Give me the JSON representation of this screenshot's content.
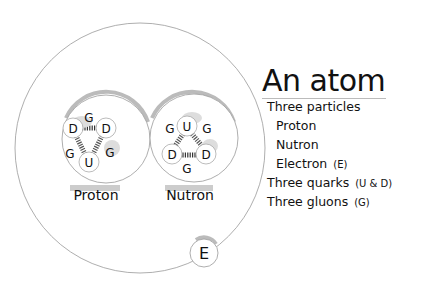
{
  "title": "An atom",
  "list": {
    "particles_heading": "Three particles",
    "particles": [
      {
        "label": "Proton",
        "note": ""
      },
      {
        "label": "Nutron",
        "note": ""
      },
      {
        "label": "Electron",
        "note": "(E)"
      }
    ],
    "quarks": {
      "label": "Three quarks",
      "note": "(U & D)"
    },
    "gluons": {
      "label": "Three gluons",
      "note": "(G)"
    }
  },
  "diagram": {
    "proton_label": "Proton",
    "nutron_label": "Nutron",
    "electron_label": "E",
    "proton_quarks": [
      "D",
      "D",
      "U"
    ],
    "proton_gluons": [
      "G",
      "G",
      "G"
    ],
    "nutron_quarks": [
      "U",
      "D",
      "D"
    ],
    "nutron_gluons": [
      "G",
      "G",
      "G"
    ]
  },
  "colors": {
    "line": "#888888",
    "shadow": "#bbbbbb",
    "text": "#111111"
  }
}
